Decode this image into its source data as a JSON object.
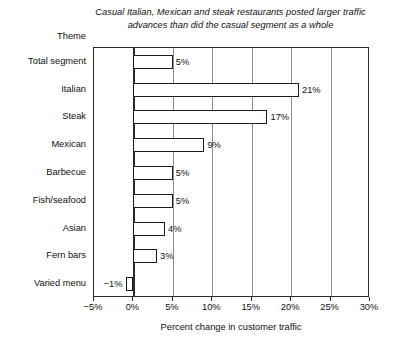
{
  "chart_data": {
    "type": "bar",
    "orientation": "horizontal",
    "title": "Casual Italian, Mexican and steak restaurants posted larger traffic advances than did the casual segment as a whole",
    "title_line1": "Casual Italian, Mexican and steak restaurants posted larger traffic",
    "title_line2": "advances than did the casual segment as a whole",
    "ylabel": "Theme",
    "xlabel": "Percent change in customer traffic",
    "categories": [
      "Total segment",
      "Italian",
      "Steak",
      "Mexican",
      "Barbecue",
      "Fish/seafood",
      "Asian",
      "Fern bars",
      "Varied menu"
    ],
    "values": [
      5,
      21,
      17,
      9,
      5,
      5,
      4,
      3,
      -1
    ],
    "data_labels": [
      "5%",
      "21%",
      "17%",
      "9%",
      "5%",
      "5%",
      "4%",
      "3%",
      "−1%"
    ],
    "xlim": [
      -5,
      30
    ],
    "xticks": [
      -5,
      0,
      5,
      10,
      15,
      20,
      25,
      30
    ],
    "xtick_labels": [
      "−5%",
      "0%",
      "5%",
      "10%",
      "15%",
      "20%",
      "25%",
      "30%"
    ],
    "grid": true,
    "grid_axis": "x",
    "legend": false,
    "colors": {
      "bar_fill": "#ffffff",
      "bar_edge": "#1d1d1d",
      "frame": "#2b2b2b",
      "gridline": "#8d8d8d",
      "text": "#111111",
      "background": "#ffffff"
    }
  }
}
